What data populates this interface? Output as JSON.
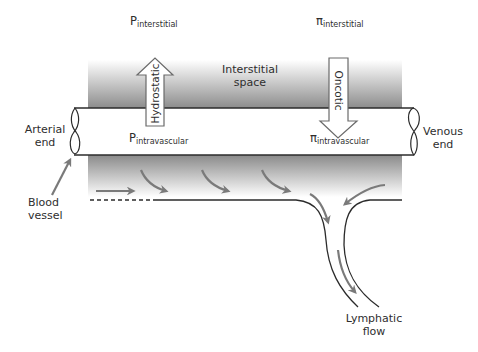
{
  "labels": {
    "p_interstitial": {
      "symbol": "P",
      "subscript": "interstitial"
    },
    "pi_interstitial": {
      "symbol": "π",
      "subscript": "interstitial"
    },
    "p_intravascular": {
      "symbol": "P",
      "subscript": "intravascular"
    },
    "pi_intravascular": {
      "symbol": "π",
      "subscript": "intravascular"
    },
    "interstitial_space": [
      "Interstitial",
      "space"
    ],
    "hydrostatic": "Hydrostatic",
    "oncotic": "Oncotic",
    "arterial_end": [
      "Arterial",
      "end"
    ],
    "venous_end": [
      "Venous",
      "end"
    ],
    "blood_vessel": [
      "Blood",
      "vessel"
    ],
    "lymphatic_flow": [
      "Lymphatic",
      "flow"
    ]
  },
  "colors": {
    "gray_band": "#8c8c8c",
    "arrow_gray": "#7a7a7a",
    "line": "#2b2b2b"
  }
}
